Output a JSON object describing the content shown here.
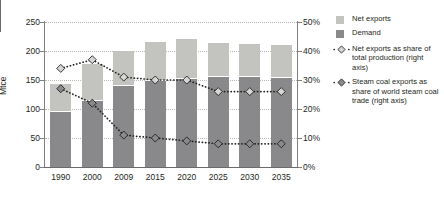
{
  "chart_data": {
    "type": "bar",
    "title": "",
    "subtitle": "",
    "xlabel": "",
    "ylabel": "Mtce",
    "ylabel_right": "",
    "categories": [
      "1990",
      "2000",
      "2009",
      "2015",
      "2020",
      "2025",
      "2030",
      "2035"
    ],
    "ylim": [
      0,
      250
    ],
    "yticks": [
      "0",
      "50",
      "100",
      "150",
      "200",
      "250"
    ],
    "ytick_values": [
      0,
      50,
      100,
      150,
      200,
      250
    ],
    "ylim_right": [
      0,
      50
    ],
    "yticks_right": [
      "0%",
      "10%",
      "20%",
      "30%",
      "40%",
      "50%"
    ],
    "ytick_values_right": [
      0,
      10,
      20,
      30,
      40,
      50
    ],
    "grid": true,
    "legend_position": "right",
    "stacked": true,
    "series": [
      {
        "name": "Net exports",
        "type": "bar",
        "axis": "left",
        "unit": "Mtce",
        "color": "#c3c4c0",
        "values": [
          48,
          65,
          60,
          68,
          69,
          58,
          57,
          57
        ]
      },
      {
        "name": "Demand",
        "type": "bar",
        "axis": "left",
        "unit": "Mtce",
        "color": "#89898b",
        "values": [
          95,
          113,
          140,
          148,
          152,
          155,
          155,
          153
        ]
      },
      {
        "name": "Net exports as share of total production (right axis)",
        "type": "line",
        "axis": "right",
        "unit": "%",
        "color": "#231f20",
        "marker": "diamond-light",
        "marker_fill": "#d6d7d3",
        "values": [
          34,
          37,
          31,
          30,
          30,
          26,
          26,
          26
        ]
      },
      {
        "name": "Steam coal exports as share of world steam coal trade (right axis)",
        "type": "line",
        "axis": "right",
        "unit": "%",
        "color": "#231f20",
        "marker": "diamond-dark",
        "marker_fill": "#8a8a8c",
        "values": [
          27,
          22,
          11,
          10,
          9,
          8,
          8,
          8
        ]
      }
    ],
    "totals": [
      143,
      178,
      200,
      216,
      221,
      213,
      212,
      210
    ]
  },
  "legend": {
    "items": [
      {
        "kind": "swatch",
        "label": "Net exports",
        "color": "#c3c4c0"
      },
      {
        "kind": "swatch",
        "label": "Demand",
        "color": "#89898b"
      },
      {
        "kind": "marker-light",
        "label": "Net exports as share of total production (right axis)"
      },
      {
        "kind": "marker-dark",
        "label": "Steam coal exports as share of world steam coal trade (right axis)"
      }
    ]
  },
  "colors": {
    "net_exports": "#c3c4c0",
    "demand": "#89898b",
    "line": "#231f20",
    "marker_light": "#d6d7d3",
    "marker_dark": "#8a8a8c",
    "axis": "#808080",
    "grid": "#b9b9b9",
    "text": "#231f20",
    "background": "#ffffff"
  }
}
